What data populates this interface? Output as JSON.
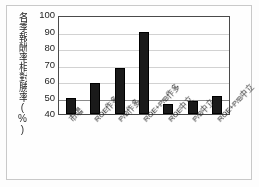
{
  "chart_data": {
    "type": "bar",
    "title": "",
    "xlabel": "",
    "ylabel": "各季報酬率相對勝率(%)",
    "categories": [
      "市場",
      "ROE作多",
      "P/B作多",
      "ROE+P/B作多",
      "ROE中立",
      "P/B中立",
      "ROE+P/B中立"
    ],
    "values": [
      49.5,
      59,
      68,
      89.5,
      46,
      48,
      51
    ],
    "ylim": [
      40,
      100
    ],
    "yticks": [
      100,
      90,
      80,
      70,
      60,
      50,
      40
    ],
    "grid": true,
    "legend": "none",
    "reference_line": 50,
    "bar_color": "#1a1a1a",
    "axis_color": "#4a4a4a",
    "gridline_color": "#d2d2d2",
    "reference_line_color": "#8a8a8a",
    "background_color": "#ffffff"
  }
}
